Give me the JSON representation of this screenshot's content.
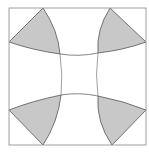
{
  "diagram": {
    "colors": {
      "background": "#ffffff",
      "stroke": "#555555",
      "square_stroke": "#888888",
      "shade": "#c8c8c8"
    },
    "square": {
      "x": 9,
      "y": 8,
      "size": 137
    },
    "shaded_regions": [
      "top-left",
      "top-right",
      "bottom-left",
      "bottom-right"
    ],
    "arcs": [
      "top",
      "bottom",
      "left",
      "right"
    ]
  }
}
